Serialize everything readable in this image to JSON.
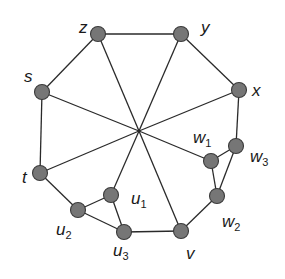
{
  "diagram": {
    "type": "graph",
    "center": {
      "x": 139,
      "y": 131
    },
    "nodes": [
      {
        "id": "z",
        "label": "z",
        "sub": "",
        "x": 98,
        "y": 34,
        "lx": 79,
        "ly": 33
      },
      {
        "id": "y",
        "label": "y",
        "sub": "",
        "x": 181,
        "y": 34,
        "lx": 201,
        "ly": 33
      },
      {
        "id": "x",
        "label": "x",
        "sub": "",
        "x": 239,
        "y": 90,
        "lx": 252,
        "ly": 96
      },
      {
        "id": "s",
        "label": "s",
        "sub": "",
        "x": 42,
        "y": 92,
        "lx": 24,
        "ly": 82
      },
      {
        "id": "t",
        "label": "t",
        "sub": "",
        "x": 40,
        "y": 173,
        "lx": 22,
        "ly": 183
      },
      {
        "id": "w1",
        "label": "w",
        "sub": "1",
        "x": 211,
        "y": 161,
        "lx": 193,
        "ly": 143
      },
      {
        "id": "w3",
        "label": "w",
        "sub": "3",
        "x": 236,
        "y": 146,
        "lx": 250,
        "ly": 162
      },
      {
        "id": "w2",
        "label": "w",
        "sub": "2",
        "x": 217,
        "y": 196,
        "lx": 222,
        "ly": 227
      },
      {
        "id": "v",
        "label": "v",
        "sub": "",
        "x": 181,
        "y": 231,
        "lx": 186,
        "ly": 259
      },
      {
        "id": "u1",
        "label": "u",
        "sub": "1",
        "x": 111,
        "y": 195,
        "lx": 131,
        "ly": 204
      },
      {
        "id": "u2",
        "label": "u",
        "sub": "2",
        "x": 78,
        "y": 210,
        "lx": 56,
        "ly": 235
      },
      {
        "id": "u3",
        "label": "u",
        "sub": "3",
        "x": 124,
        "y": 232,
        "lx": 113,
        "ly": 256
      }
    ],
    "edges": [
      [
        "z",
        "y"
      ],
      [
        "y",
        "x"
      ],
      [
        "x",
        "w3"
      ],
      [
        "w3",
        "w1"
      ],
      [
        "w3",
        "w2"
      ],
      [
        "w1",
        "w2"
      ],
      [
        "w2",
        "v"
      ],
      [
        "v",
        "u3"
      ],
      [
        "u3",
        "u2"
      ],
      [
        "u3",
        "u1"
      ],
      [
        "u1",
        "u2"
      ],
      [
        "u2",
        "t"
      ],
      [
        "t",
        "s"
      ],
      [
        "s",
        "z"
      ]
    ],
    "spokes": [
      "z",
      "y",
      "x",
      "s",
      "t",
      "w1",
      "v",
      "u1"
    ]
  }
}
